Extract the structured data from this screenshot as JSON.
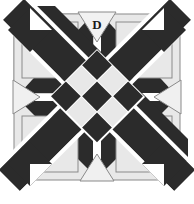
{
  "figure": {
    "name": "quilt-block-pattern-d",
    "label": "D",
    "label_position": "top-center-triangle",
    "canvas": {
      "width": 194,
      "height": 204
    },
    "colors": {
      "dark": "#2b2b2b",
      "light": "#e8e8e8",
      "background": "#ffffff",
      "outline": "#8a8a8a",
      "label_text": "#1a1a1a"
    },
    "block": {
      "x": 14,
      "y": 14,
      "width": 166,
      "height": 166
    },
    "parts": [
      {
        "name": "corner-square-top-left",
        "tone": "light"
      },
      {
        "name": "corner-square-top-right",
        "tone": "light"
      },
      {
        "name": "corner-square-bottom-left",
        "tone": "light"
      },
      {
        "name": "corner-square-bottom-right",
        "tone": "light"
      },
      {
        "name": "diagonal-band-nw-se",
        "tone": "dark"
      },
      {
        "name": "diagonal-band-ne-sw",
        "tone": "dark"
      },
      {
        "name": "edge-triangle-top",
        "tone": "light"
      },
      {
        "name": "edge-triangle-left",
        "tone": "light"
      },
      {
        "name": "edge-triangle-right",
        "tone": "light"
      },
      {
        "name": "edge-triangle-bottom",
        "tone": "light"
      },
      {
        "name": "center-checkerboard",
        "tone": "mixed"
      }
    ],
    "center_checkerboard": {
      "rows": 3,
      "cols": 3,
      "rotation_deg": 45,
      "cells": [
        [
          "dark",
          "light",
          "dark"
        ],
        [
          "light",
          "dark",
          "light"
        ],
        [
          "dark",
          "light",
          "dark"
        ]
      ]
    }
  }
}
